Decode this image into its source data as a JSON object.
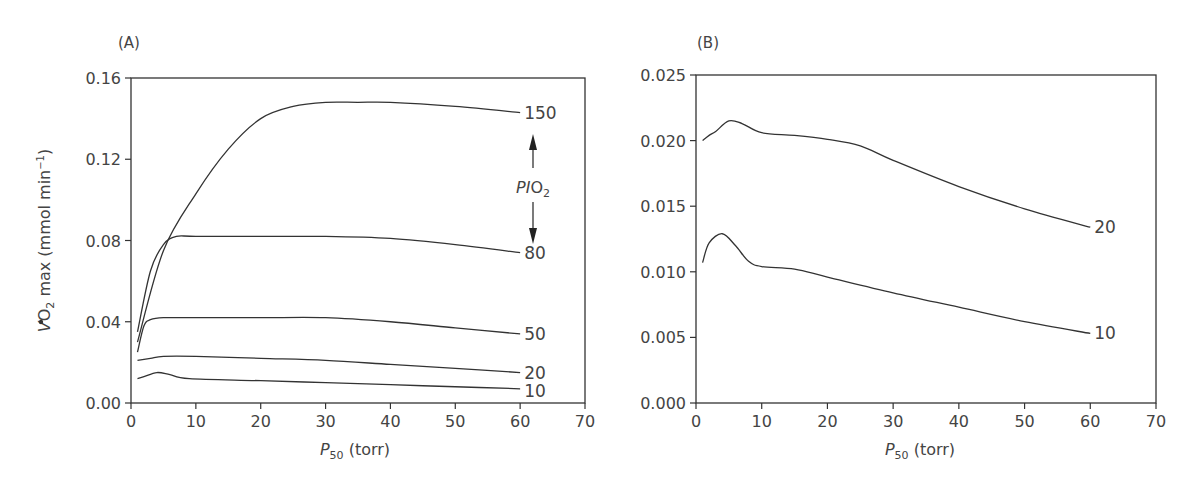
{
  "chart_data": [
    {
      "panel": "(A)",
      "type": "line",
      "xlabel": "P50 (torr)",
      "ylabel": "VO2 max (mmol min-1)",
      "xlim": [
        0,
        70
      ],
      "ylim": [
        0,
        0.16
      ],
      "xticks": [
        "0",
        "10",
        "20",
        "30",
        "40",
        "50",
        "60",
        "70"
      ],
      "yticks": [
        "0.00",
        "0.04",
        "0.08",
        "0.12",
        "0.16"
      ],
      "annotation": "PIO2",
      "series": [
        {
          "name": "150",
          "x": [
            1,
            5,
            10,
            15,
            20,
            25,
            30,
            35,
            40,
            50,
            60
          ],
          "values": [
            0.03,
            0.075,
            0.103,
            0.125,
            0.14,
            0.146,
            0.148,
            0.148,
            0.148,
            0.146,
            0.143
          ]
        },
        {
          "name": "80",
          "x": [
            1,
            3,
            5,
            7,
            10,
            20,
            30,
            40,
            50,
            60
          ],
          "values": [
            0.035,
            0.065,
            0.078,
            0.082,
            0.082,
            0.082,
            0.082,
            0.081,
            0.078,
            0.074
          ]
        },
        {
          "name": "50",
          "x": [
            1,
            2,
            3,
            5,
            10,
            20,
            30,
            40,
            50,
            60
          ],
          "values": [
            0.025,
            0.038,
            0.041,
            0.042,
            0.042,
            0.042,
            0.042,
            0.04,
            0.037,
            0.034
          ]
        },
        {
          "name": "20",
          "x": [
            1,
            3,
            5,
            10,
            20,
            30,
            40,
            50,
            60
          ],
          "values": [
            0.021,
            0.022,
            0.023,
            0.023,
            0.022,
            0.021,
            0.019,
            0.017,
            0.015
          ]
        },
        {
          "name": "10",
          "x": [
            1,
            2,
            4,
            6,
            9,
            20,
            30,
            40,
            50,
            60
          ],
          "values": [
            0.012,
            0.013,
            0.015,
            0.014,
            0.012,
            0.011,
            0.01,
            0.009,
            0.008,
            0.007
          ]
        }
      ]
    },
    {
      "panel": "(B)",
      "type": "line",
      "xlabel": "P50 (torr)",
      "ylabel": "",
      "xlim": [
        0,
        70
      ],
      "ylim": [
        0,
        0.025
      ],
      "xticks": [
        "0",
        "10",
        "20",
        "30",
        "40",
        "50",
        "60",
        "70"
      ],
      "yticks": [
        "0.000",
        "0.005",
        "0.010",
        "0.015",
        "0.020",
        "0.025"
      ],
      "series": [
        {
          "name": "20",
          "x": [
            1,
            2,
            3,
            5,
            7,
            10,
            15,
            20,
            25,
            30,
            40,
            50,
            60
          ],
          "values": [
            0.02,
            0.0204,
            0.0207,
            0.0215,
            0.0213,
            0.0206,
            0.0204,
            0.0201,
            0.0196,
            0.0185,
            0.0165,
            0.0148,
            0.0134
          ]
        },
        {
          "name": "10",
          "x": [
            1,
            2,
            4,
            6,
            8,
            10,
            15,
            20,
            30,
            40,
            50,
            60
          ],
          "values": [
            0.0107,
            0.0122,
            0.0129,
            0.012,
            0.0108,
            0.0104,
            0.0102,
            0.0096,
            0.0084,
            0.0073,
            0.0062,
            0.0053
          ]
        }
      ]
    }
  ],
  "labels": {
    "panel_a": "(A)",
    "panel_b": "(B)",
    "xlabel_sub": "50",
    "xlabel_main": "P",
    "xlabel_unit": " (torr)",
    "ylabel_pre": "VO",
    "ylabel_sub": "2",
    "ylabel_post": " max (mmol min",
    "ylabel_sup": "−1",
    "ylabel_end": ")",
    "pio2_main": "PIO",
    "pio2_sub": "2"
  }
}
